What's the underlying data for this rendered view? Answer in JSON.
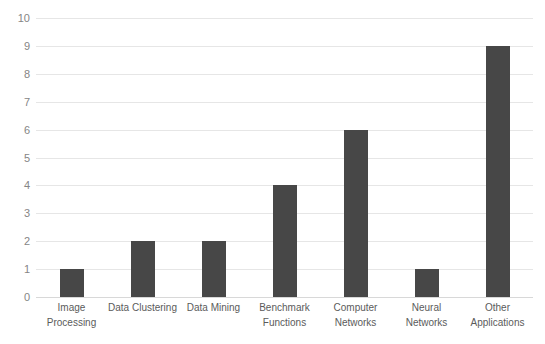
{
  "chart_data": {
    "type": "bar",
    "title": "",
    "subtitle": "",
    "xlabel": "",
    "ylabel": "",
    "categories": [
      "Image Processing",
      "Data Clustering",
      "Data Mining",
      "Benchmark Functions",
      "Computer Networks",
      "Neural Networks",
      "Other Applications"
    ],
    "category_lines": [
      [
        "Image",
        "Processing"
      ],
      [
        "Data Clustering"
      ],
      [
        "Data Mining"
      ],
      [
        "Benchmark",
        "Functions"
      ],
      [
        "Computer",
        "Networks"
      ],
      [
        "Neural",
        "Networks"
      ],
      [
        "Other",
        "Applications"
      ]
    ],
    "values": [
      1,
      2,
      2,
      4,
      6,
      1,
      9
    ],
    "ylim": [
      0,
      10
    ],
    "ytick_labels": [
      "10",
      "9",
      "8",
      "7",
      "6",
      "5",
      "4",
      "3",
      "2",
      "1",
      "0"
    ],
    "ytick_values": [
      10,
      9,
      8,
      7,
      6,
      5,
      4,
      3,
      2,
      1,
      0
    ],
    "grid": true,
    "legend": false,
    "legend_position": "none",
    "bar_color": "#474747",
    "gridline_color": "#e6e6e6",
    "tick_label_color": "#858585",
    "category_label_color": "#5b5b5b",
    "background_color": "#ffffff"
  }
}
